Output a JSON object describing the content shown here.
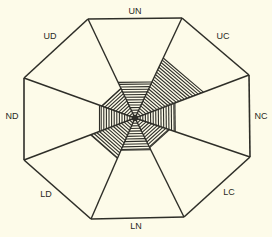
{
  "diagram": {
    "type": "radar-octagon",
    "center": [
      135,
      118
    ],
    "stroke_color": "#2e2e28",
    "background": "#fdfbe9",
    "outer_vertices": [
      [
        88,
        19
      ],
      [
        182,
        18
      ],
      [
        249,
        75
      ],
      [
        250,
        157
      ],
      [
        184,
        217
      ],
      [
        91,
        219
      ],
      [
        24,
        160
      ],
      [
        24,
        78
      ]
    ],
    "sectors": [
      {
        "label": "UN",
        "label_pos": [
          135,
          11
        ],
        "extent": 0.36
      },
      {
        "label": "UC",
        "label_pos": [
          223,
          36
        ],
        "extent": 0.6
      },
      {
        "label": "NC",
        "label_pos": [
          261,
          116
        ],
        "extent": 0.35
      },
      {
        "label": "LC",
        "label_pos": [
          229,
          192
        ],
        "extent": 0.3
      },
      {
        "label": "LN",
        "label_pos": [
          136,
          226
        ],
        "extent": 0.32
      },
      {
        "label": "LD",
        "label_pos": [
          46,
          194
        ],
        "extent": 0.4
      },
      {
        "label": "ND",
        "label_pos": [
          12,
          116
        ],
        "extent": 0.32
      },
      {
        "label": "UD",
        "label_pos": [
          50,
          36
        ],
        "extent": 0.3
      }
    ]
  }
}
